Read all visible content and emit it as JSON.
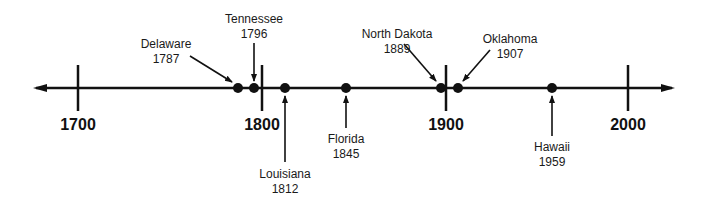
{
  "colors": {
    "line": "#111111",
    "text": "#1a1a1a",
    "background": "#ffffff"
  },
  "axis": {
    "start_year": 1700,
    "end_year": 2000,
    "ticks": [
      {
        "year": "1700",
        "x": 78
      },
      {
        "year": "1800",
        "x": 262
      },
      {
        "year": "1900",
        "x": 446
      },
      {
        "year": "2000",
        "x": 628
      }
    ]
  },
  "events": [
    {
      "state": "Delaware",
      "year": "1787",
      "x": 238,
      "side": "above"
    },
    {
      "state": "Tennessee",
      "year": "1796",
      "x": 254,
      "side": "above"
    },
    {
      "state": "Louisiana",
      "year": "1812",
      "x": 285,
      "side": "below"
    },
    {
      "state": "Florida",
      "year": "1845",
      "x": 346,
      "side": "below"
    },
    {
      "state": "North Dakota",
      "year": "1889",
      "x": 441,
      "side": "above"
    },
    {
      "state": "Oklahoma",
      "year": "1907",
      "x": 458,
      "side": "above"
    },
    {
      "state": "Hawaii",
      "year": "1959",
      "x": 552,
      "side": "below"
    }
  ]
}
